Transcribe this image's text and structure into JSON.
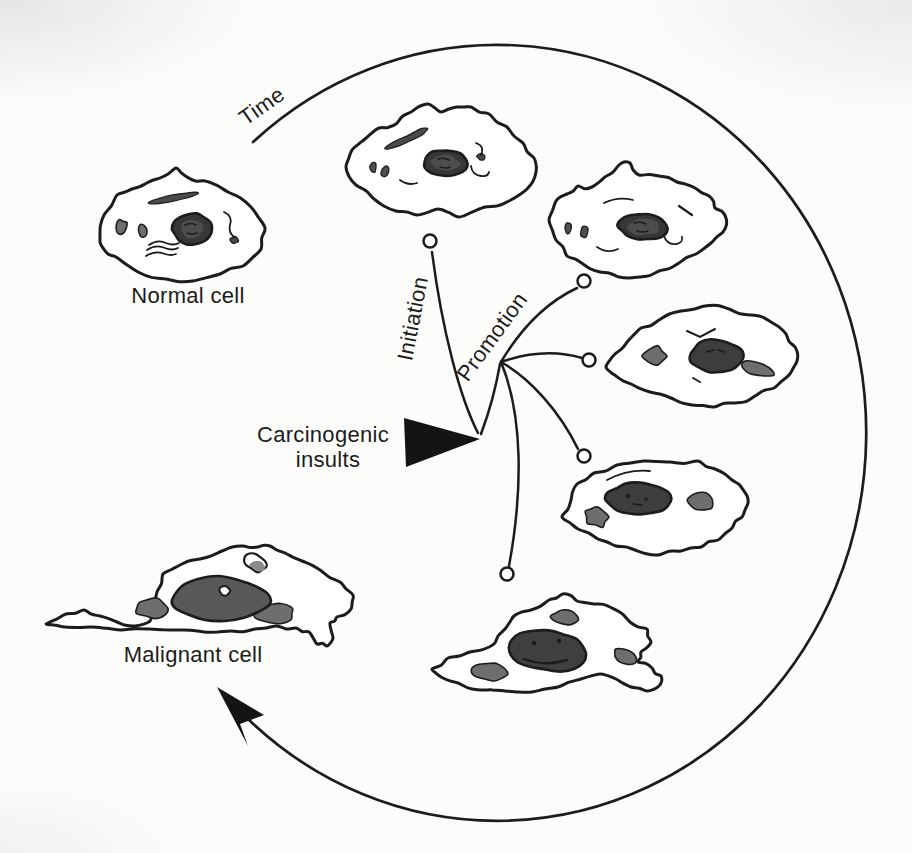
{
  "labels": {
    "time": "Time",
    "initiation": "Initiation",
    "promotion": "Promotion",
    "carcinogenic_insults_line1": "Carcinogenic",
    "carcinogenic_insults_line2": "insults",
    "normal_cell": "Normal cell",
    "malignant_cell": "Malignant cell"
  },
  "colors": {
    "background": "#fcfcfa",
    "ink": "#1c1c1c",
    "nucleus": "#373737",
    "nucleus_inner": "#4d4d4d",
    "organelle": "#6e6e6e",
    "malignant_nucleus": "#585858"
  },
  "structure": {
    "cells_shown": 7,
    "initiation_branches": 1,
    "promotion_branches": 4
  }
}
